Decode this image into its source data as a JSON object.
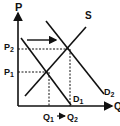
{
  "diagram": {
    "type": "supply-demand",
    "axes": {
      "y_label": "P",
      "x_label": "Q"
    },
    "curves": [
      {
        "name": "S",
        "label": "S",
        "kind": "supply"
      },
      {
        "name": "D1",
        "label": "D",
        "subscript": "1",
        "kind": "demand"
      },
      {
        "name": "D2",
        "label": "D",
        "subscript": "2",
        "kind": "demand"
      }
    ],
    "price_levels": [
      {
        "label": "P",
        "subscript": "1"
      },
      {
        "label": "P",
        "subscript": "2"
      }
    ],
    "quantity_levels": [
      {
        "label": "Q",
        "subscript": "1"
      },
      {
        "label": "Q",
        "subscript": "2"
      }
    ],
    "shift": "Demand shifts right from D1 to D2",
    "colors": {
      "line": "#111111",
      "background": "#ffffff"
    }
  }
}
